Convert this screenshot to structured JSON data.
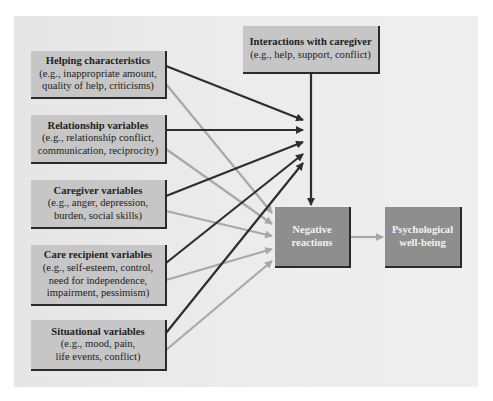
{
  "diagram": {
    "colors": {
      "panel": "#ebebeb",
      "box_light": "#c6c6c6",
      "box_dark": "#8e8e8e",
      "arrow_dark": "#2e2e2e",
      "arrow_light": "#a8a8a8",
      "shadow": "#2a2a2a"
    },
    "predictors": [
      {
        "title": "Helping characteristics",
        "detail": [
          "(e.g., inappropriate amount,",
          "quality of help, criticisms)"
        ]
      },
      {
        "title": "Relationship variables",
        "detail": [
          "(e.g., relationship conflict,",
          "communication, reciprocity)"
        ]
      },
      {
        "title": "Caregiver variables",
        "detail": [
          "(e.g., anger, depression,",
          "burden, social skills)"
        ]
      },
      {
        "title": "Care recipient variables",
        "detail": [
          "(e.g., self-esteem, control,",
          "need for independence,",
          "impairment, pessimism)"
        ]
      },
      {
        "title": "Situational variables",
        "detail": [
          "(e.g., mood, pain,",
          "life events, conflict)"
        ]
      }
    ],
    "mediator_top": {
      "title": "Interactions with caregiver",
      "detail": [
        "(e.g., help, support, conflict)"
      ]
    },
    "outcome_mid": {
      "lines": [
        "Negative",
        "reactions"
      ]
    },
    "outcome_final": {
      "lines": [
        "Psychological",
        "well-being"
      ]
    },
    "edges": [
      {
        "from": "predictors.*",
        "to": "interactions-line",
        "style": "dark"
      },
      {
        "from": "predictors.*",
        "to": "outcome_mid",
        "style": "light"
      },
      {
        "from": "mediator_top",
        "to": "outcome_mid",
        "style": "dark"
      },
      {
        "from": "outcome_mid",
        "to": "outcome_final",
        "style": "light"
      }
    ]
  }
}
